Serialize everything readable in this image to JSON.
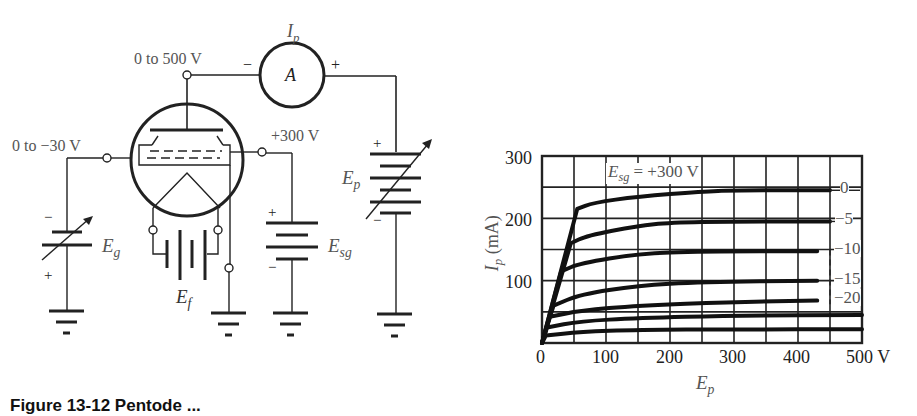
{
  "figure": {
    "caption_partial": "Figure 13-12  Pentode ..."
  },
  "circuit": {
    "plate_supply_label": "0 to 500 V",
    "grid_supply_label": "0 to −30 V",
    "screen_supply_label": "+300 V",
    "ammeter": {
      "symbol": "A",
      "current_label_main": "I",
      "current_label_sub": "p",
      "minus": "−",
      "plus": "+"
    },
    "batteries": {
      "grid": {
        "main": "E",
        "sub": "g",
        "plus": "+",
        "minus": "−",
        "variable": true
      },
      "filament": {
        "main": "E",
        "sub": "f"
      },
      "screen": {
        "main": "E",
        "sub": "sg",
        "plus": "+",
        "minus": "−"
      },
      "plate": {
        "main": "E",
        "sub": "p",
        "plus": "+",
        "minus": "−",
        "variable": true
      }
    },
    "icons": [
      "vacuum-tube-pentode-icon",
      "ammeter-icon",
      "battery-icon",
      "variable-battery-icon",
      "ground-icon",
      "terminal-icon"
    ]
  },
  "chart_data": {
    "type": "line",
    "title": "",
    "annotation": "E_sg = +300 V",
    "annotation_main": "E",
    "annotation_sub": "sg",
    "annotation_rest": " = +300 V",
    "xlabel_main": "E",
    "xlabel_sub": "p",
    "ylabel_main": "I",
    "ylabel_sub": "p",
    "ylabel_rest": " (mA)",
    "xlim": [
      0,
      500
    ],
    "ylim": [
      0,
      300
    ],
    "x_ticks": [
      "0",
      "100",
      "200",
      "300",
      "400",
      "500 V"
    ],
    "y_ticks": [
      "100",
      "200",
      "300"
    ],
    "grid": true,
    "grid_x_step": 50,
    "grid_y_step": 50,
    "series": [
      {
        "name": "0",
        "label": "0",
        "points": [
          [
            0,
            0
          ],
          [
            55,
            215
          ],
          [
            80,
            225
          ],
          [
            150,
            235
          ],
          [
            250,
            243
          ],
          [
            300,
            245
          ],
          [
            450,
            245
          ]
        ]
      },
      {
        "name": "-5",
        "label": "−5",
        "points": [
          [
            0,
            0
          ],
          [
            45,
            160
          ],
          [
            70,
            172
          ],
          [
            150,
            188
          ],
          [
            200,
            193
          ],
          [
            300,
            195
          ],
          [
            450,
            195
          ]
        ]
      },
      {
        "name": "-10",
        "label": "−10",
        "points": [
          [
            0,
            0
          ],
          [
            30,
            115
          ],
          [
            60,
            128
          ],
          [
            150,
            143
          ],
          [
            250,
            147
          ],
          [
            430,
            147
          ]
        ]
      },
      {
        "name": "-15",
        "label": "−15",
        "points": [
          [
            0,
            0
          ],
          [
            18,
            60
          ],
          [
            60,
            78
          ],
          [
            150,
            92
          ],
          [
            250,
            98
          ],
          [
            430,
            100
          ]
        ]
      },
      {
        "name": "-20",
        "label": "−20",
        "points": [
          [
            0,
            0
          ],
          [
            12,
            42
          ],
          [
            60,
            52
          ],
          [
            150,
            60
          ],
          [
            300,
            66
          ],
          [
            430,
            68
          ]
        ]
      },
      {
        "name": "-25",
        "label": "",
        "points": [
          [
            0,
            0
          ],
          [
            8,
            25
          ],
          [
            60,
            35
          ],
          [
            150,
            40
          ],
          [
            300,
            44
          ],
          [
            500,
            45
          ]
        ]
      },
      {
        "name": "-30",
        "label": "",
        "points": [
          [
            0,
            0
          ],
          [
            6,
            12
          ],
          [
            60,
            18
          ],
          [
            150,
            21
          ],
          [
            300,
            22
          ],
          [
            500,
            22
          ]
        ]
      }
    ]
  }
}
